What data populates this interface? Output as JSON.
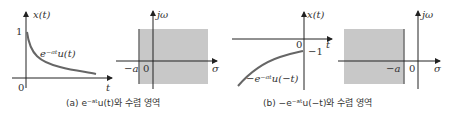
{
  "figure": {
    "panel_a": {
      "time_plot": {
        "y_axis_label": "x(t)",
        "x_axis_label": "t",
        "y_tick": "1",
        "origin": "0",
        "curve_label": "e^{-at}u(t)",
        "curve_label_display": "e⁻ᵃᵗu(t)"
      },
      "roc_plot": {
        "y_axis_label": "jω",
        "x_axis_label": "σ",
        "boundary_label": "−a",
        "origin": "0",
        "shaded_region": "Re(s) > −a",
        "shade_color": "#c8c8c8"
      },
      "caption": "(a) e⁻ᵃᵗu(t)와 수렴 영역"
    },
    "panel_b": {
      "time_plot": {
        "y_axis_label": "x(t)",
        "x_axis_label": "t",
        "y_tick": "−1",
        "origin": "0",
        "curve_label": "-e^{-at}u(-t)",
        "curve_label_display": "−e⁻ᵃᵗu(−t)"
      },
      "roc_plot": {
        "y_axis_label": "jω",
        "x_axis_label": "σ",
        "boundary_label": "−a",
        "origin": "0",
        "shaded_region": "Re(s) < −a",
        "shade_color": "#c8c8c8"
      },
      "caption": "(b) −e⁻ᵃᵗu(−t)와 수렴 영역"
    },
    "colors": {
      "axis": "#222222",
      "curve": "#666666",
      "shade": "#c8c8c8",
      "boundary": "#777777"
    }
  }
}
